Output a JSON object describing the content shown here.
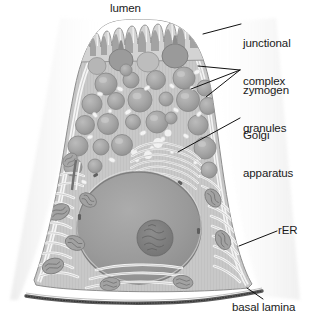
{
  "figure": {
    "style": "grayscale textbook line illustration",
    "colors": {
      "background": "#ffffff",
      "cytoplasm": "#c9c9c9",
      "granule_fill": "#a8a8a8",
      "granule_edge": "#8a8a8a",
      "nucleus_fill": "#9d9d9d",
      "nucleolus_fill": "#7d7d7d",
      "membrane_light": "#f2f2f2",
      "basal_lamina": "#5a5a5a",
      "label_text": "#1a1a1a",
      "leader_line": "#111111"
    }
  },
  "labels": {
    "lumen": "lumen",
    "junctional_complex_line1": "junctional",
    "junctional_complex_line2": "complex",
    "zymogen_line1": "zymogen",
    "zymogen_line2": "granules",
    "golgi_line1": "Golgi",
    "golgi_line2": "apparatus",
    "rer": "rER",
    "basal_lamina": "basal lamina"
  },
  "structures": [
    {
      "name": "lumen",
      "label": "lumen",
      "position": "top-center, above microvilli"
    },
    {
      "name": "microvilli",
      "label": "microvilli",
      "position": "apical surface, finger-like projections"
    },
    {
      "name": "junctional-complex",
      "label": "junctional complex",
      "position": "apical lateral cell border, upper right"
    },
    {
      "name": "zymogen-granules",
      "label": "zymogen granules",
      "position": "apical cytoplasm, numerous round granules"
    },
    {
      "name": "golgi-apparatus",
      "label": "Golgi apparatus",
      "position": "supranuclear, stacked curved cisternae"
    },
    {
      "name": "nucleus",
      "label": "nucleus",
      "position": "basal, large round"
    },
    {
      "name": "nucleolus",
      "label": "nucleolus",
      "position": "center of nucleus"
    },
    {
      "name": "rough-endoplasmic-reticulum",
      "label": "rER",
      "position": "basal cytoplasm, parallel wavy cisternae"
    },
    {
      "name": "mitochondria",
      "label": "mitochondria",
      "position": "basal cytoplasm, oval with cristae"
    },
    {
      "name": "basal-lamina",
      "label": "basal lamina",
      "position": "bottom, stippled dark band"
    }
  ],
  "leaders": [
    {
      "for": "junctional complex",
      "from": [
        241,
        24
      ],
      "to": [
        203,
        34
      ]
    },
    {
      "for": "zymogen granules",
      "from": [
        240,
        70
      ],
      "to": [
        198,
        66
      ]
    },
    {
      "for": "zymogen granules",
      "from": [
        240,
        70
      ],
      "to": [
        193,
        88
      ]
    },
    {
      "for": "zymogen granules",
      "from": [
        240,
        70
      ],
      "to": [
        205,
        96
      ]
    },
    {
      "for": "Golgi apparatus",
      "from": [
        240,
        118
      ],
      "to": [
        178,
        152
      ]
    },
    {
      "for": "rER",
      "from": [
        277,
        231
      ],
      "to": [
        240,
        246
      ]
    },
    {
      "for": "basal lamina",
      "from": [
        262,
        299
      ],
      "to": [
        246,
        287
      ]
    }
  ]
}
